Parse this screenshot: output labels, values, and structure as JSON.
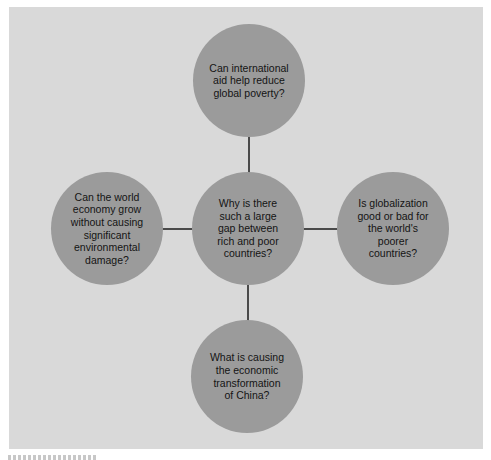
{
  "diagram": {
    "type": "hub-and-spoke concept map",
    "colors": {
      "page_background": "#ffffff",
      "panel_background": "#d9d9d9",
      "node_fill": "#9b9b9b",
      "connector": "#4a4a4a",
      "text": "#141414"
    },
    "center": {
      "text": "Why is there\nsuch a large\ngap between\nrich and poor\ncountries?"
    },
    "spokes": {
      "top": {
        "text": "Can international\naid help reduce\nglobal poverty?"
      },
      "left": {
        "text": "Can the world\neconomy grow\nwithout causing\nsignificant\nenvironmental\ndamage?"
      },
      "right": {
        "text": "Is globalization\ngood or bad for\nthe world's\npoorer\ncountries?"
      },
      "bottom": {
        "text": "What is causing\nthe economic\ntransformation\nof China?"
      }
    }
  }
}
